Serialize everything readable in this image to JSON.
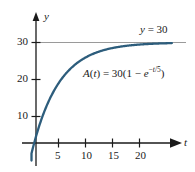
{
  "figure": {
    "title": "",
    "background_color": "#ffffff",
    "curve_color": "#2d5d7c",
    "axis_color": "#1a1a1a",
    "asymptote_color": "#9a9a9a",
    "text_color": "#1a1a1a"
  },
  "axes": {
    "y_axis_name": "y",
    "x_axis_name": "t",
    "y_ticks": [
      "10",
      "20",
      "30"
    ],
    "x_ticks": [
      "5",
      "10",
      "15",
      "20"
    ]
  },
  "annotations": {
    "asymptote": {
      "var": "y",
      "equals": " = 30"
    },
    "equation": {
      "fn": "A",
      "open_paren": "(",
      "fn_var": "t",
      "close_paren": ")",
      "equals": " = 30(1 − ",
      "base": "e",
      "exponent_sign": "−",
      "exponent_var": "t",
      "exponent_div": "/5",
      "tail": ")"
    }
  },
  "chart_data": {
    "type": "line",
    "title": "",
    "xlabel": "t",
    "ylabel": "y",
    "xlim": [
      0,
      26
    ],
    "ylim": [
      0,
      34
    ],
    "grid": false,
    "legend": null,
    "xticks": [
      5,
      10,
      15,
      20
    ],
    "yticks": [
      10,
      20,
      30
    ],
    "annotations": [
      {
        "text": "y = 30",
        "x": 21.5,
        "y": 32.5
      },
      {
        "text": "A(t) = 30(1 - e^(-t/5))",
        "x": 10.5,
        "y": 23.5
      }
    ],
    "series": [
      {
        "name": "A(t) = 30(1 - e^(-t/5))",
        "formula": "30*(1 - exp(-t/5))",
        "color": "#2d5d7c",
        "x": [
          0,
          1,
          2,
          3,
          4,
          5,
          6,
          7,
          8,
          9,
          10,
          11,
          12,
          13,
          14,
          15,
          16,
          17,
          18,
          19,
          20,
          21,
          22,
          23,
          24,
          25,
          26
        ],
        "y": [
          0,
          5.44,
          9.89,
          13.54,
          16.52,
          18.96,
          20.96,
          22.59,
          23.94,
          25.04,
          25.94,
          26.68,
          27.28,
          27.78,
          28.18,
          28.51,
          28.78,
          29.0,
          29.18,
          29.33,
          29.45,
          29.55,
          29.63,
          29.7,
          29.75,
          29.8,
          29.83
        ]
      },
      {
        "name": "asymptote y = 30",
        "type": "horizontal-line",
        "value": 30,
        "color": "#9a9a9a",
        "x": [
          0,
          26
        ],
        "y": [
          30,
          30
        ]
      }
    ]
  }
}
